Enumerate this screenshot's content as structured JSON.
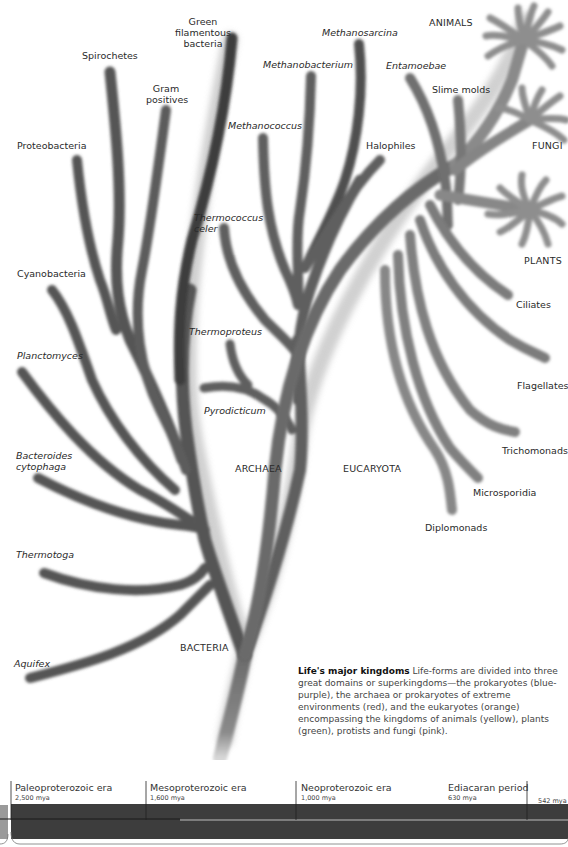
{
  "figure": {
    "title": "Life's major kingdoms",
    "caption_title": "Life's major kingdoms",
    "caption_body": " Life-forms are divided into three great domains or superkingdoms—the prokaryotes (blue-purple), the archaea or prokaryotes of extreme environments (red), and the eukaryotes (orange) encompassing the kingdoms of animals (yellow), plants (green), protists and fungi (pink)."
  },
  "domains": {
    "bacteria": "BACTERIA",
    "archaea": "ARCHAEA",
    "eucaryota": "EUCARYOTA"
  },
  "bacteria_branches": [
    {
      "label": "Green\nfilamentous\nbacteria",
      "italic": false
    },
    {
      "label": "Spirochetes",
      "italic": false
    },
    {
      "label": "Gram\npositives",
      "italic": false
    },
    {
      "label": "Proteobacteria",
      "italic": false
    },
    {
      "label": "Cyanobacteria",
      "italic": false
    },
    {
      "label": "Planctomyces",
      "italic": true
    },
    {
      "label": "Bacteroides\ncytophaga",
      "italic": true
    },
    {
      "label": "Thermotoga",
      "italic": true
    },
    {
      "label": "Aquifex",
      "italic": true
    }
  ],
  "archaea_branches": [
    {
      "label": "Methanosarcina",
      "italic": true
    },
    {
      "label": "Methanobacterium",
      "italic": true
    },
    {
      "label": "Methanococcus",
      "italic": true
    },
    {
      "label": "Halophiles",
      "italic": false
    },
    {
      "label": "Thermococcus\nceler",
      "italic": true
    },
    {
      "label": "Thermoproteus",
      "italic": true
    },
    {
      "label": "Pyrodicticum",
      "italic": true
    }
  ],
  "eucaryota_branches": [
    {
      "label": "ANIMALS",
      "italic": false
    },
    {
      "label": "Entamoebae",
      "italic": true
    },
    {
      "label": "Slime molds",
      "italic": false
    },
    {
      "label": "FUNGI",
      "italic": false
    },
    {
      "label": "PLANTS",
      "italic": false
    },
    {
      "label": "Ciliates",
      "italic": false
    },
    {
      "label": "Flagellates",
      "italic": false
    },
    {
      "label": "Trichomonads",
      "italic": false
    },
    {
      "label": "Microsporidia",
      "italic": false
    },
    {
      "label": "Diplomonads",
      "italic": false
    }
  ],
  "timeline": {
    "eras": [
      {
        "name": "Paleoproterozoic era",
        "mya": "2,500 mya"
      },
      {
        "name": "Mesoproterozoic era",
        "mya": "1,600 mya"
      },
      {
        "name": "Neoproterozoic era",
        "mya": "1,000 mya"
      },
      {
        "name": "Ediacaran period",
        "mya": "630 mya"
      },
      {
        "name": "",
        "mya": "542 mya"
      }
    ]
  },
  "colors": {
    "branch_dark": "#4a4a4a",
    "branch_mid": "#6e6e6e",
    "branch_light": "#8c8c8c",
    "timeline_band": "#3c3c3c",
    "background": "#ffffff"
  }
}
